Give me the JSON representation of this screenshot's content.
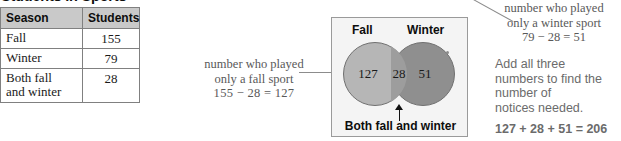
{
  "table": {
    "title": "Students in Sports",
    "headers": [
      "Season",
      "Students"
    ],
    "rows": [
      {
        "season": "Fall",
        "students": "155"
      },
      {
        "season": "Winter",
        "students": "79"
      },
      {
        "season": "Both fall\nand winter",
        "students": "28"
      }
    ],
    "row0_season": "Fall",
    "row0_students": "155",
    "row1_season": "Winter",
    "row1_students": "79",
    "row2_season_line1": "Both fall",
    "row2_season_line2": "and winter",
    "row2_students": "28"
  },
  "annotations": {
    "fall_only": {
      "line1": "number who played",
      "line2": "only a fall sport",
      "line3": "155 − 28 = 127"
    },
    "winter_only": {
      "line1": "number who played",
      "line2": "only a winter sport",
      "line3": "79 − 28 = 51"
    },
    "add_all": {
      "line1": "Add all three",
      "line2": "numbers to find the",
      "line3": "number of",
      "line4": "notices needed."
    },
    "total_equation": "127 + 28 + 51 = 206"
  },
  "venn": {
    "left_label": "Fall",
    "right_label": "Winter",
    "left_only_value": "127",
    "intersection_value": "28",
    "right_only_value": "51",
    "caption": "Both fall and winter"
  },
  "colors": {
    "page_background": "#ffffff",
    "venn_panel_background": "#f4f4f4",
    "venn_panel_border": "#9a9a9a",
    "circle_fall_fill": "#b6b6b6",
    "circle_winter_fill": "#8f8f8f",
    "circle_overlap_fill": "#9d9d9d",
    "table_header_fill": "#c9c9c9",
    "table_border": "#808080",
    "annotation_text": "#595959",
    "callout_text": "#6b6b6b",
    "body_text": "#1a1a1a"
  },
  "chart_data": {
    "type": "table",
    "title": "Students in Sports",
    "categories": [
      "Fall",
      "Winter",
      "Both fall and winter"
    ],
    "values": [
      155,
      79,
      28
    ],
    "xlabel": "Season",
    "ylabel": "Students",
    "venn_regions": {
      "fall_only": 127,
      "intersection": 28,
      "winter_only": 51,
      "union_total": 206
    },
    "annotations": [
      "155 − 28 = 127",
      "79 − 28 = 51",
      "127 + 28 + 51 = 206"
    ]
  }
}
